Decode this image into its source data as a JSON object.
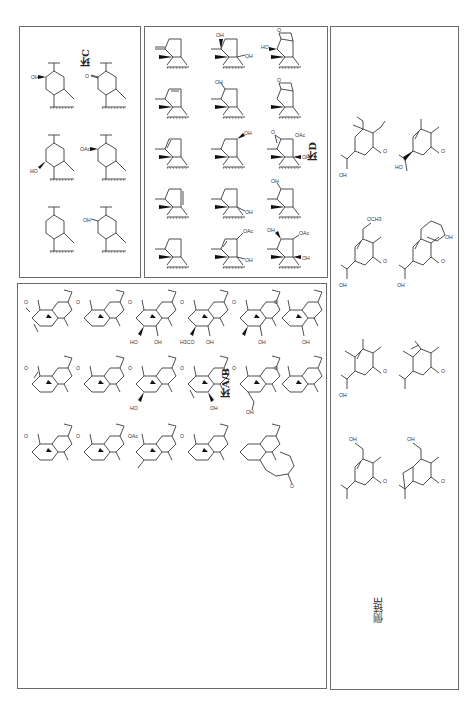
{
  "figure": {
    "orientation": "rotated-90",
    "panels": [
      {
        "id": "C",
        "label": "环C",
        "structure_count": 6,
        "substituents": [
          "OH",
          "HO",
          "O",
          "OAc",
          "OH",
          ""
        ]
      },
      {
        "id": "D",
        "label": "环D",
        "structure_count": 15,
        "substituents": [
          "OH",
          "OH",
          "OAc",
          "OH",
          "OAc",
          "OH",
          "OAc",
          "OH",
          "HO",
          "O",
          "OH"
        ]
      },
      {
        "id": "AB",
        "label": "环A/B",
        "structure_count": 17,
        "substituents": [
          "OH",
          "H3CO",
          "OH",
          "OH",
          "HO",
          "OH",
          "OAc",
          "O",
          "OH",
          "HO",
          "OH"
        ]
      },
      {
        "id": "E",
        "label": "侧链E",
        "structure_count": 10,
        "substituents": [
          "OH",
          "OCH3",
          "OH",
          "HO",
          "OH",
          "OH",
          "O",
          "OH"
        ]
      }
    ]
  },
  "atoms": {
    "oh": "OH",
    "ho": "HO",
    "o": "O",
    "oac": "OAc",
    "och3": "OCH3",
    "h3co": "H3CO"
  }
}
